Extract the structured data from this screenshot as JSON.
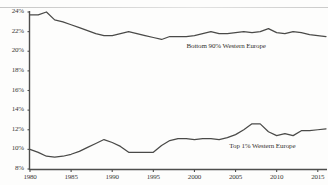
{
  "chart_data": {
    "type": "line",
    "title": "",
    "subtitle": "",
    "xlabel": "",
    "ylabel": "",
    "xlim": [
      1980,
      2016
    ],
    "ylim": [
      8,
      24
    ],
    "grid": false,
    "legend_position": "inline-annotation",
    "ytick_labels": [
      "8%",
      "10%",
      "12%",
      "14%",
      "16%",
      "18%",
      "20%",
      "22%",
      "24%"
    ],
    "ytick_values": [
      8,
      10,
      12,
      14,
      16,
      18,
      20,
      22,
      24
    ],
    "xtick_labels": [
      "1980",
      "1985",
      "1990",
      "1995",
      "2000",
      "2005",
      "2010",
      "2015"
    ],
    "xtick_values": [
      1980,
      1985,
      1990,
      1995,
      2000,
      2005,
      2010,
      2015
    ],
    "x": [
      1980,
      1981,
      1982,
      1983,
      1984,
      1985,
      1986,
      1987,
      1988,
      1989,
      1990,
      1991,
      1992,
      1993,
      1994,
      1995,
      1996,
      1997,
      1998,
      1999,
      2000,
      2001,
      2002,
      2003,
      2004,
      2005,
      2006,
      2007,
      2008,
      2009,
      2010,
      2011,
      2012,
      2013,
      2014,
      2015,
      2016
    ],
    "series": [
      {
        "name": "Bottom 90% Western Europe",
        "annotation": "Bottom 90% Western Europe",
        "color": "#4a4a48",
        "values": [
          23.7,
          23.7,
          24.0,
          23.2,
          23.0,
          22.7,
          22.4,
          22.1,
          21.8,
          21.6,
          21.6,
          21.8,
          22.0,
          21.8,
          21.6,
          21.4,
          21.2,
          21.5,
          21.5,
          21.5,
          21.6,
          21.8,
          22.0,
          21.8,
          21.8,
          21.9,
          22.0,
          21.9,
          22.0,
          22.3,
          21.9,
          21.8,
          22.0,
          21.9,
          21.7,
          21.6,
          21.5
        ]
      },
      {
        "name": "Top 1% Western Europe",
        "annotation": "Top 1% Western Europe",
        "color": "#4a4a48",
        "values": [
          10.0,
          9.7,
          9.3,
          9.2,
          9.3,
          9.5,
          9.8,
          10.2,
          10.6,
          11.0,
          10.7,
          10.3,
          9.7,
          9.7,
          9.7,
          9.7,
          10.4,
          10.9,
          11.1,
          11.1,
          11.0,
          11.1,
          11.1,
          11.0,
          11.2,
          11.5,
          12.0,
          12.6,
          12.6,
          11.8,
          11.4,
          11.6,
          11.4,
          11.9,
          11.9,
          12.0,
          12.1
        ]
      }
    ]
  },
  "annotations": {
    "bottom90_label": "Bottom 90% Western Europe",
    "top1_label": "Top 1% Western Europe"
  }
}
